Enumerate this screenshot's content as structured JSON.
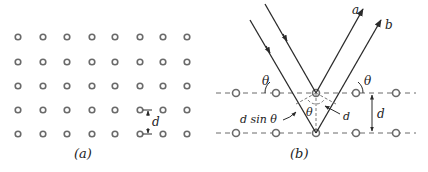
{
  "figure": {
    "panel_a": {
      "caption": "(a)",
      "lattice": {
        "rows": 5,
        "cols": 8
      },
      "spacing_label": "d"
    },
    "panel_b": {
      "caption": "(b)",
      "ray_labels": [
        "a",
        "b"
      ],
      "angle_label": "θ",
      "spacing_label": "d",
      "path_diff_label": "d sin θ",
      "inner_d_label": "d"
    },
    "colors": {
      "ink": "#2a2a2a",
      "atom": "#6a6a6a",
      "background": "#ffffff"
    }
  }
}
